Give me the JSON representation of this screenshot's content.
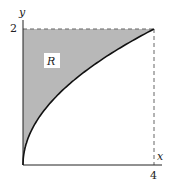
{
  "diagram": {
    "x_axis_label": "x",
    "y_axis_label": "y",
    "x_tick": "4",
    "y_tick": "2",
    "region_label": "R",
    "curve": "y = sqrt(x)",
    "region_fill": "#b8b8b8",
    "x_range": [
      0,
      4
    ],
    "y_range": [
      0,
      2
    ]
  }
}
